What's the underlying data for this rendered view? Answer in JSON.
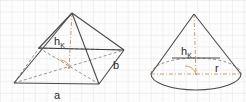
{
  "canvas": {
    "width": 246,
    "height": 102,
    "background_color": "#fdfdfd"
  },
  "grid": {
    "minor_spacing": 5.8,
    "major_spacing": 11.6,
    "minor_color": "#f0f0f0",
    "major_color": "#e2e2e2",
    "visible": true
  },
  "style": {
    "solid_edge_color": "#4a4a4a",
    "hidden_edge_color": "#6e6e6e",
    "axis_color": "#c8915c",
    "label_color": "#2b2b2b",
    "height_line_color": "#3a3a3a"
  },
  "figures": [
    {
      "name": "pyramid",
      "shape": "rectangular-pyramid",
      "labels": {
        "height": "h",
        "height_subscript": "K",
        "base_front": "a",
        "base_side": "b"
      },
      "geometry": {
        "apex": [
          72,
          13
        ],
        "base_front_left": [
          14,
          83
        ],
        "base_front_right": [
          99,
          84
        ],
        "base_back_right": [
          124,
          50
        ],
        "base_back_left": [
          39,
          48
        ],
        "base_center": [
          69,
          66
        ]
      }
    },
    {
      "name": "cone",
      "shape": "cone",
      "labels": {
        "height": "h",
        "height_subscript": "K",
        "radius": "r"
      },
      "geometry": {
        "apex": [
          194,
          14
        ],
        "base_center": [
          196,
          74
        ],
        "base_radius_x": 45,
        "base_radius_y": 16
      }
    }
  ],
  "annotations": {
    "right_angle_marker": "right-angle-arc",
    "hidden_line_style": "dashed",
    "axis_line_style": "dash-dot"
  }
}
